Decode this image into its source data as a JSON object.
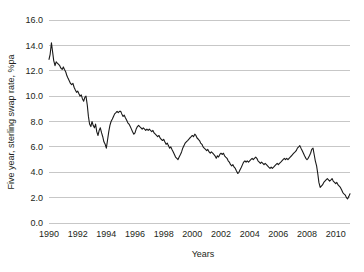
{
  "chart_data": {
    "type": "line",
    "title": "",
    "xlabel": "Years",
    "ylabel": "Five year, sterling swap rate, %pa",
    "xlim": [
      1990,
      2011
    ],
    "ylim": [
      0,
      16
    ],
    "grid": true,
    "legend": "none",
    "y_ticks": [
      "0.0",
      "2.0",
      "4.0",
      "6.0",
      "8.0",
      "10.0",
      "12.0",
      "14.0",
      "16.0"
    ],
    "y_tick_values": [
      0,
      2,
      4,
      6,
      8,
      10,
      12,
      14,
      16
    ],
    "x_ticks": [
      "1990",
      "1992",
      "1994",
      "1996",
      "1998",
      "2000",
      "2002",
      "2004",
      "2006",
      "2008",
      "2010"
    ],
    "x_tick_values": [
      1990,
      1992,
      1994,
      1996,
      1998,
      2000,
      2002,
      2004,
      2006,
      2008,
      2010
    ],
    "series": [
      {
        "name": "Five year sterling swap rate",
        "color": "#1a1a1a",
        "x": [
          1990.0,
          1990.08,
          1990.17,
          1990.25,
          1990.33,
          1990.42,
          1990.5,
          1990.58,
          1990.67,
          1990.75,
          1990.83,
          1990.92,
          1991.0,
          1991.08,
          1991.17,
          1991.25,
          1991.33,
          1991.42,
          1991.5,
          1991.58,
          1991.67,
          1991.75,
          1991.83,
          1991.92,
          1992.0,
          1992.08,
          1992.17,
          1992.25,
          1992.33,
          1992.42,
          1992.5,
          1992.58,
          1992.67,
          1992.75,
          1992.83,
          1992.92,
          1993.0,
          1993.08,
          1993.17,
          1993.25,
          1993.33,
          1993.42,
          1993.5,
          1993.58,
          1993.67,
          1993.75,
          1993.83,
          1993.92,
          1994.0,
          1994.08,
          1994.17,
          1994.25,
          1994.33,
          1994.42,
          1994.5,
          1994.58,
          1994.67,
          1994.75,
          1994.83,
          1994.92,
          1995.0,
          1995.08,
          1995.17,
          1995.25,
          1995.33,
          1995.42,
          1995.5,
          1995.58,
          1995.67,
          1995.75,
          1995.83,
          1995.92,
          1996.0,
          1996.08,
          1996.17,
          1996.25,
          1996.33,
          1996.42,
          1996.5,
          1996.58,
          1996.67,
          1996.75,
          1996.83,
          1996.92,
          1997.0,
          1997.08,
          1997.17,
          1997.25,
          1997.33,
          1997.42,
          1997.5,
          1997.58,
          1997.67,
          1997.75,
          1997.83,
          1997.92,
          1998.0,
          1998.08,
          1998.17,
          1998.25,
          1998.33,
          1998.42,
          1998.5,
          1998.58,
          1998.67,
          1998.75,
          1998.83,
          1998.92,
          1999.0,
          1999.08,
          1999.17,
          1999.25,
          1999.33,
          1999.42,
          1999.5,
          1999.58,
          1999.67,
          1999.75,
          1999.83,
          1999.92,
          2000.0,
          2000.08,
          2000.17,
          2000.25,
          2000.33,
          2000.42,
          2000.5,
          2000.58,
          2000.67,
          2000.75,
          2000.83,
          2000.92,
          2001.0,
          2001.08,
          2001.17,
          2001.25,
          2001.33,
          2001.42,
          2001.5,
          2001.58,
          2001.67,
          2001.75,
          2001.83,
          2001.92,
          2002.0,
          2002.08,
          2002.17,
          2002.25,
          2002.33,
          2002.42,
          2002.5,
          2002.58,
          2002.67,
          2002.75,
          2002.83,
          2002.92,
          2003.0,
          2003.08,
          2003.17,
          2003.25,
          2003.33,
          2003.42,
          2003.5,
          2003.58,
          2003.67,
          2003.75,
          2003.83,
          2003.92,
          2004.0,
          2004.08,
          2004.17,
          2004.25,
          2004.33,
          2004.42,
          2004.5,
          2004.58,
          2004.67,
          2004.75,
          2004.83,
          2004.92,
          2005.0,
          2005.08,
          2005.17,
          2005.25,
          2005.33,
          2005.42,
          2005.5,
          2005.58,
          2005.67,
          2005.75,
          2005.83,
          2005.92,
          2006.0,
          2006.08,
          2006.17,
          2006.25,
          2006.33,
          2006.42,
          2006.5,
          2006.58,
          2006.67,
          2006.75,
          2006.83,
          2006.92,
          2007.0,
          2007.08,
          2007.17,
          2007.25,
          2007.33,
          2007.42,
          2007.5,
          2007.58,
          2007.67,
          2007.75,
          2007.83,
          2007.92,
          2008.0,
          2008.08,
          2008.17,
          2008.25,
          2008.33,
          2008.42,
          2008.5,
          2008.58,
          2008.67,
          2008.75,
          2008.83,
          2008.92,
          2009.0,
          2009.08,
          2009.17,
          2009.25,
          2009.33,
          2009.42,
          2009.5,
          2009.58,
          2009.67,
          2009.75,
          2009.83,
          2009.92,
          2010.0,
          2010.08,
          2010.17,
          2010.25,
          2010.33,
          2010.42,
          2010.5,
          2010.58,
          2010.67,
          2010.75,
          2010.83,
          2010.92,
          2011.0
        ],
        "y": [
          12.9,
          13.3,
          14.2,
          13.5,
          12.8,
          12.4,
          12.7,
          12.6,
          12.5,
          12.4,
          12.2,
          12.1,
          12.3,
          12.1,
          11.9,
          11.6,
          11.4,
          11.2,
          11.0,
          10.9,
          11.0,
          10.7,
          10.5,
          10.3,
          10.4,
          10.2,
          10.0,
          10.1,
          9.8,
          9.6,
          9.9,
          10.0,
          9.3,
          8.4,
          7.8,
          7.6,
          8.0,
          7.7,
          7.5,
          7.8,
          7.2,
          6.9,
          7.3,
          7.5,
          7.1,
          6.8,
          6.4,
          6.2,
          5.9,
          6.5,
          7.2,
          7.7,
          8.0,
          8.2,
          8.4,
          8.6,
          8.7,
          8.8,
          8.7,
          8.8,
          8.8,
          8.6,
          8.4,
          8.5,
          8.3,
          8.1,
          7.9,
          7.8,
          7.6,
          7.4,
          7.2,
          7.0,
          7.1,
          7.4,
          7.6,
          7.7,
          7.6,
          7.5,
          7.4,
          7.5,
          7.4,
          7.3,
          7.4,
          7.3,
          7.4,
          7.3,
          7.2,
          7.3,
          7.1,
          7.0,
          6.9,
          6.8,
          6.9,
          6.7,
          6.6,
          6.5,
          6.6,
          6.4,
          6.2,
          6.3,
          6.1,
          5.9,
          6.0,
          5.8,
          5.6,
          5.4,
          5.2,
          5.1,
          5.0,
          5.2,
          5.4,
          5.6,
          5.9,
          6.1,
          6.3,
          6.4,
          6.5,
          6.6,
          6.7,
          6.8,
          6.9,
          6.8,
          7.0,
          6.9,
          6.7,
          6.6,
          6.5,
          6.3,
          6.2,
          6.0,
          5.9,
          5.8,
          5.7,
          5.8,
          5.6,
          5.5,
          5.6,
          5.5,
          5.4,
          5.3,
          5.1,
          5.3,
          5.2,
          5.4,
          5.5,
          5.4,
          5.5,
          5.3,
          5.2,
          5.1,
          4.9,
          4.8,
          4.6,
          4.5,
          4.6,
          4.4,
          4.3,
          4.1,
          3.9,
          4.0,
          4.2,
          4.4,
          4.6,
          4.8,
          4.9,
          4.8,
          4.9,
          4.8,
          4.9,
          5.0,
          5.1,
          5.0,
          5.1,
          5.2,
          5.1,
          4.9,
          4.8,
          4.7,
          4.8,
          4.7,
          4.6,
          4.7,
          4.6,
          4.5,
          4.4,
          4.3,
          4.4,
          4.3,
          4.4,
          4.5,
          4.6,
          4.7,
          4.6,
          4.7,
          4.8,
          4.9,
          5.0,
          5.1,
          5.0,
          5.1,
          5.0,
          5.1,
          5.2,
          5.3,
          5.4,
          5.5,
          5.6,
          5.7,
          5.9,
          6.0,
          6.1,
          5.9,
          5.7,
          5.5,
          5.3,
          5.1,
          5.0,
          5.1,
          5.3,
          5.5,
          5.8,
          5.9,
          5.4,
          4.9,
          4.5,
          3.9,
          3.2,
          2.8,
          2.9,
          3.0,
          3.2,
          3.3,
          3.4,
          3.5,
          3.4,
          3.3,
          3.4,
          3.5,
          3.3,
          3.2,
          3.1,
          3.2,
          3.0,
          2.9,
          2.8,
          2.6,
          2.4,
          2.3,
          2.2,
          2.0,
          1.9,
          2.1,
          2.3
        ]
      }
    ]
  },
  "figure": {
    "background_color": "#ffffff",
    "line_color": "#1a1a1a",
    "grid_color": "#b9b9b9"
  }
}
